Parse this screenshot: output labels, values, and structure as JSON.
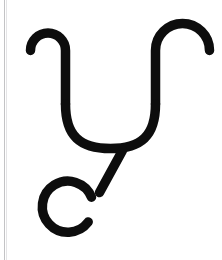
{
  "canvas": {
    "width": 222,
    "height": 260,
    "background_color": "#ffffff",
    "description": "Scanned line-art glyph: a wide U-shaped bowl with outward-curling hooks at both upper ends, a short diagonal tail descending from the bowl's base into a nearly closed circle with a gap at its upper-left."
  },
  "artifacts": {
    "scan_edge_line": {
      "name": "page-edge-line",
      "x": 4,
      "color": "#b9b9bb",
      "width": 1
    },
    "scan_edge_line_faint": {
      "name": "page-edge-line-faint",
      "x": 6,
      "color": "#d9d9dc",
      "width": 1
    }
  },
  "glyph": {
    "name": "hooked-u-with-circle",
    "ink_color": "#0d0d0d",
    "stroke_width": 9.5,
    "line_cap": "round",
    "parts": {
      "left_hook": {
        "name": "left-hook",
        "path": "M 30.5 50.5 A 17.5 17.5 0 0 1 65.5 50.5 L 65.5 104",
        "terminus_point": [
          30.5,
          50.5
        ]
      },
      "right_hook": {
        "name": "right-hook",
        "path": "M 209.5 50.5 A 17.5 17.5 0 0 0 155.5 50.5 L 155.5 104",
        "terminus_point": [
          209.5,
          50.5
        ]
      },
      "bowl": {
        "name": "u-bowl",
        "path": "M 65.5 104 C 65.5 136, 80 148.5, 110.5 148.5 C 141 148.5, 155.5 136, 155.5 104",
        "bottom_y": 148.5
      },
      "tail": {
        "name": "diagonal-tail",
        "path": "M 122.5 150.5 L 99.5 192.5"
      },
      "circle": {
        "name": "open-circle",
        "center": [
          112.5,
          214.5
        ],
        "radius": 25.5,
        "gap_start_deg": 168,
        "gap_end_deg": 214,
        "path": "M 88.2 222.0 A 25.5 25.5 0 1 1 91.5 197.2"
      }
    }
  }
}
